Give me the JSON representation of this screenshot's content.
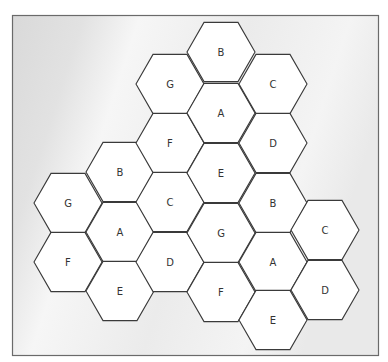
{
  "diagram": {
    "type": "hexagonal-cell-reuse-pattern",
    "colors": {
      "cell_fill": "#ffffff",
      "cell_stroke": "#3a3a3a",
      "frame_stroke": "#6a6a6a",
      "background": "#e6e6e6"
    },
    "cells": [
      {
        "label": "G",
        "col": 0,
        "cx": 68,
        "cy": 203
      },
      {
        "label": "F",
        "col": 0,
        "cx": 68,
        "cy": 262
      },
      {
        "label": "B",
        "col": 1,
        "cx": 120,
        "cy": 172
      },
      {
        "label": "A",
        "col": 1,
        "cx": 120,
        "cy": 232
      },
      {
        "label": "E",
        "col": 1,
        "cx": 120,
        "cy": 291
      },
      {
        "label": "G",
        "col": 2,
        "cx": 170,
        "cy": 84
      },
      {
        "label": "F",
        "col": 2,
        "cx": 170,
        "cy": 143
      },
      {
        "label": "C",
        "col": 2,
        "cx": 170,
        "cy": 202
      },
      {
        "label": "D",
        "col": 2,
        "cx": 170,
        "cy": 262
      },
      {
        "label": "B",
        "col": 3,
        "cx": 221,
        "cy": 52
      },
      {
        "label": "A",
        "col": 3,
        "cx": 221,
        "cy": 113
      },
      {
        "label": "E",
        "col": 3,
        "cx": 221,
        "cy": 173
      },
      {
        "label": "G",
        "col": 3,
        "cx": 221,
        "cy": 233
      },
      {
        "label": "F",
        "col": 3,
        "cx": 221,
        "cy": 292
      },
      {
        "label": "C",
        "col": 4,
        "cx": 273,
        "cy": 84
      },
      {
        "label": "D",
        "col": 4,
        "cx": 273,
        "cy": 143
      },
      {
        "label": "B",
        "col": 4,
        "cx": 273,
        "cy": 203
      },
      {
        "label": "A",
        "col": 4,
        "cx": 273,
        "cy": 262
      },
      {
        "label": "E",
        "col": 4,
        "cx": 273,
        "cy": 320
      },
      {
        "label": "C",
        "col": 5,
        "cx": 325,
        "cy": 230
      },
      {
        "label": "D",
        "col": 5,
        "cx": 325,
        "cy": 290
      }
    ]
  }
}
